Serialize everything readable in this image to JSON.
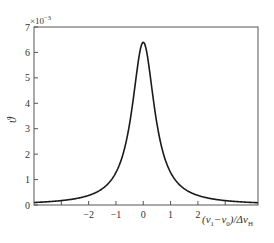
{
  "chart_data": {
    "type": "line",
    "title": "",
    "xlabel": "(ν1−ν0)/ΔνH",
    "xlabel_parts": {
      "open": "(ν",
      "sub1": "1",
      "mid": "−ν",
      "sub2": "0",
      "close": ")/Δν",
      "sub3": "H"
    },
    "ylabel": "ϑ",
    "y_multiplier": "×10",
    "y_multiplier_exp": "−3",
    "xlim": [
      -4.0,
      4.2
    ],
    "ylim": [
      0,
      7
    ],
    "x_ticks": [
      -3,
      -2,
      -1,
      0,
      1,
      2,
      3
    ],
    "x_tick_labels": [
      "",
      "−2",
      "−1",
      "0",
      "1",
      "2",
      ""
    ],
    "y_ticks": [
      0,
      1,
      2,
      3,
      4,
      5,
      6,
      7
    ],
    "y_tick_labels": [
      "0",
      "1",
      "2",
      "3",
      "4",
      "5",
      "6",
      "7"
    ],
    "grid": false,
    "legend": null,
    "series": [
      {
        "name": "Lorentzian line shape",
        "x": [
          -4.0,
          -3.5,
          -3.0,
          -2.5,
          -2.0,
          -1.5,
          -1.25,
          -1.0,
          -0.75,
          -0.5,
          -0.375,
          -0.25,
          -0.125,
          0,
          0.125,
          0.25,
          0.375,
          0.5,
          0.75,
          1.0,
          1.25,
          1.5,
          2.0,
          2.5,
          3.0,
          3.5,
          4.0,
          4.2
        ],
        "values": [
          0.1,
          0.13,
          0.17,
          0.25,
          0.38,
          0.64,
          0.88,
          1.28,
          1.97,
          3.2,
          4.1,
          5.12,
          6.02,
          6.4,
          6.02,
          5.12,
          4.1,
          3.2,
          1.97,
          1.28,
          0.88,
          0.64,
          0.38,
          0.25,
          0.17,
          0.13,
          0.1,
          0.09
        ]
      }
    ],
    "peak": {
      "x": 0,
      "y": 6.4
    },
    "line_color": "#1a1a1a"
  }
}
